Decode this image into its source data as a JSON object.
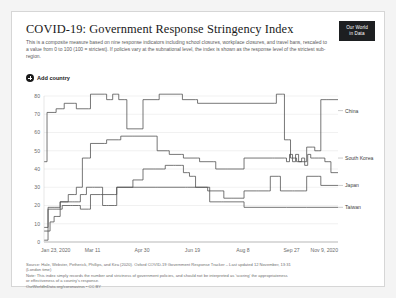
{
  "header": {
    "title": "COVID-19: Government Response Stringency Index",
    "subtitle": "This is a composite measure based on nine response indicators including school closures, workplace closures, and travel bans, rescaled to a value from 0 to 100 (100 = strictest). If policies vary at the subnational level, the index is shown as the response level of the strictest sub-region.",
    "logo_line1": "Our World",
    "logo_line2": "in Data"
  },
  "controls": {
    "add_country_label": "Add country",
    "add_country_icon": "plus-circle-icon"
  },
  "footer": {
    "source_line1": "Source: Hale, Webster, Petherick, Phillips, and Kira (2020). Oxford COVID-19 Government Response Tracker – Last updated 12 November, 13:31",
    "source_line2": "(London time)",
    "note_line1": "Note: This index simply records the number and strictness of government policies, and should not be interpreted as 'scoring' the appropriateness",
    "note_line2": "or effectiveness of a country's response.",
    "credit": "OurWorldInData.org/coronavirus • CC BY"
  },
  "chart_data": {
    "type": "line",
    "title": "COVID-19: Government Response Stringency Index",
    "xlabel": "",
    "ylabel": "",
    "grid": true,
    "legend_position": "right-inline",
    "ylim": [
      0,
      80
    ],
    "yticks": [
      0,
      10,
      20,
      30,
      40,
      50,
      60,
      70,
      80
    ],
    "ytick_labels": [
      "0",
      "10",
      "20",
      "30",
      "40",
      "50",
      "60",
      "70",
      "80"
    ],
    "xtick_labels": [
      "Jan 23, 2020",
      "Mar 11",
      "Apr 30",
      "Jun 19",
      "Aug 8",
      "Sep 27",
      "Nov 9, 2020"
    ],
    "xtick_positions": [
      0,
      48,
      97,
      147,
      197,
      245,
      291
    ],
    "x_unit": "days since Jan 23, 2020",
    "xlim": [
      0,
      291
    ],
    "line_color": "#4a4a4a",
    "series": [
      {
        "name": "China",
        "label_y_value": 72,
        "points": [
          [
            0,
            44
          ],
          [
            2,
            44
          ],
          [
            3,
            71
          ],
          [
            10,
            71
          ],
          [
            12,
            73
          ],
          [
            18,
            73
          ],
          [
            20,
            76
          ],
          [
            30,
            76
          ],
          [
            32,
            73
          ],
          [
            44,
            73
          ],
          [
            46,
            81
          ],
          [
            60,
            81
          ],
          [
            62,
            78
          ],
          [
            66,
            78
          ],
          [
            68,
            81
          ],
          [
            72,
            81
          ],
          [
            74,
            78
          ],
          [
            80,
            78
          ],
          [
            82,
            62
          ],
          [
            96,
            62
          ],
          [
            98,
            78
          ],
          [
            112,
            78
          ],
          [
            114,
            81
          ],
          [
            135,
            81
          ],
          [
            137,
            78
          ],
          [
            150,
            78
          ],
          [
            152,
            76
          ],
          [
            200,
            76
          ],
          [
            228,
            76
          ],
          [
            230,
            81
          ],
          [
            236,
            81
          ],
          [
            238,
            56
          ],
          [
            242,
            56
          ],
          [
            244,
            46
          ],
          [
            248,
            46
          ],
          [
            250,
            44
          ],
          [
            258,
            44
          ],
          [
            260,
            52
          ],
          [
            266,
            52
          ],
          [
            268,
            50
          ],
          [
            272,
            50
          ],
          [
            274,
            78
          ],
          [
            280,
            78
          ],
          [
            282,
            78
          ],
          [
            291,
            78
          ]
        ]
      },
      {
        "name": "South Korea",
        "label_y_value": 46,
        "points": [
          [
            0,
            8
          ],
          [
            2,
            8
          ],
          [
            4,
            19
          ],
          [
            6,
            19
          ],
          [
            10,
            19
          ],
          [
            14,
            19
          ],
          [
            16,
            22
          ],
          [
            22,
            22
          ],
          [
            24,
            26
          ],
          [
            30,
            26
          ],
          [
            32,
            30
          ],
          [
            36,
            30
          ],
          [
            38,
            46
          ],
          [
            44,
            46
          ],
          [
            46,
            54
          ],
          [
            60,
            54
          ],
          [
            62,
            56
          ],
          [
            74,
            56
          ],
          [
            76,
            58
          ],
          [
            88,
            58
          ],
          [
            90,
            58
          ],
          [
            96,
            58
          ],
          [
            98,
            58
          ],
          [
            110,
            58
          ],
          [
            112,
            50
          ],
          [
            122,
            50
          ],
          [
            124,
            48
          ],
          [
            136,
            48
          ],
          [
            138,
            46
          ],
          [
            152,
            46
          ],
          [
            154,
            44
          ],
          [
            168,
            44
          ],
          [
            170,
            40
          ],
          [
            180,
            40
          ],
          [
            182,
            40
          ],
          [
            196,
            40
          ],
          [
            198,
            46
          ],
          [
            226,
            46
          ],
          [
            228,
            46
          ],
          [
            238,
            46
          ],
          [
            240,
            44
          ],
          [
            243,
            48
          ],
          [
            246,
            44
          ],
          [
            249,
            48
          ],
          [
            252,
            44
          ],
          [
            255,
            46
          ],
          [
            258,
            42
          ],
          [
            261,
            48
          ],
          [
            264,
            46
          ],
          [
            268,
            46
          ],
          [
            272,
            46
          ],
          [
            276,
            46
          ],
          [
            278,
            44
          ],
          [
            282,
            44
          ],
          [
            284,
            38
          ],
          [
            291,
            38
          ]
        ]
      },
      {
        "name": "Japan",
        "label_y_value": 31,
        "points": [
          [
            0,
            1
          ],
          [
            2,
            1
          ],
          [
            4,
            6
          ],
          [
            6,
            11
          ],
          [
            10,
            14
          ],
          [
            12,
            14
          ],
          [
            16,
            22
          ],
          [
            28,
            22
          ],
          [
            30,
            22
          ],
          [
            34,
            22
          ],
          [
            36,
            26
          ],
          [
            40,
            26
          ],
          [
            42,
            30
          ],
          [
            48,
            30
          ],
          [
            50,
            30
          ],
          [
            56,
            30
          ],
          [
            58,
            20
          ],
          [
            62,
            20
          ],
          [
            64,
            20
          ],
          [
            70,
            20
          ],
          [
            72,
            30
          ],
          [
            86,
            30
          ],
          [
            88,
            34
          ],
          [
            96,
            34
          ],
          [
            98,
            40
          ],
          [
            108,
            40
          ],
          [
            110,
            40
          ],
          [
            118,
            40
          ],
          [
            120,
            42
          ],
          [
            128,
            42
          ],
          [
            130,
            42
          ],
          [
            136,
            42
          ],
          [
            138,
            38
          ],
          [
            142,
            38
          ],
          [
            144,
            36
          ],
          [
            148,
            36
          ],
          [
            150,
            30
          ],
          [
            160,
            30
          ],
          [
            162,
            28
          ],
          [
            176,
            28
          ],
          [
            178,
            24
          ],
          [
            186,
            24
          ],
          [
            188,
            24
          ],
          [
            196,
            24
          ],
          [
            198,
            28
          ],
          [
            210,
            28
          ],
          [
            212,
            28
          ],
          [
            222,
            28
          ],
          [
            224,
            36
          ],
          [
            232,
            36
          ],
          [
            234,
            28
          ],
          [
            246,
            28
          ],
          [
            248,
            28
          ],
          [
            258,
            28
          ],
          [
            260,
            36
          ],
          [
            272,
            36
          ],
          [
            274,
            31
          ],
          [
            291,
            31
          ]
        ]
      },
      {
        "name": "Taiwan",
        "label_y_value": 19,
        "points": [
          [
            0,
            6
          ],
          [
            2,
            6
          ],
          [
            4,
            18
          ],
          [
            8,
            18
          ],
          [
            12,
            18
          ],
          [
            16,
            18
          ],
          [
            18,
            20
          ],
          [
            26,
            20
          ],
          [
            28,
            20
          ],
          [
            34,
            20
          ],
          [
            36,
            18
          ],
          [
            44,
            18
          ],
          [
            46,
            26
          ],
          [
            56,
            26
          ],
          [
            58,
            26
          ],
          [
            70,
            26
          ],
          [
            72,
            30
          ],
          [
            88,
            30
          ],
          [
            90,
            30
          ],
          [
            110,
            30
          ],
          [
            112,
            30
          ],
          [
            140,
            30
          ],
          [
            142,
            30
          ],
          [
            162,
            30
          ],
          [
            164,
            22
          ],
          [
            176,
            22
          ],
          [
            178,
            22
          ],
          [
            196,
            22
          ],
          [
            198,
            19
          ],
          [
            240,
            19
          ],
          [
            260,
            19
          ],
          [
            291,
            19
          ]
        ]
      }
    ]
  }
}
